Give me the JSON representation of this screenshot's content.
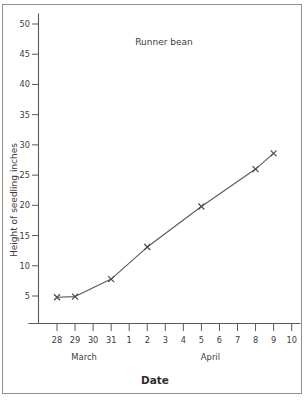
{
  "chart_data": {
    "type": "line",
    "title": "Runner bean",
    "xlabel": "Date",
    "ylabel": "Height of seedling   inches",
    "ylim": [
      0,
      52
    ],
    "xlim": [
      0,
      13
    ],
    "grid": false,
    "legend": "none",
    "y_ticks": [
      5,
      10,
      15,
      20,
      25,
      30,
      35,
      40,
      45,
      50
    ],
    "y_tick_labels": [
      "5",
      "10",
      "15",
      "20",
      "25",
      "30",
      "35",
      "40",
      "45",
      "50"
    ],
    "x_tick_labels": [
      "28",
      "29",
      "30",
      "31",
      "1",
      "2",
      "3",
      "4",
      "5",
      "6",
      "7",
      "8",
      "9",
      "10"
    ],
    "x_group_labels": [
      {
        "label": "March",
        "start_index": 0,
        "end_index": 3
      },
      {
        "label": "April",
        "start_index": 4,
        "end_index": 13
      }
    ],
    "series": [
      {
        "name": "Runner bean",
        "marker": "x",
        "color": "#595959",
        "points": [
          {
            "x_label": "28",
            "x_index": 0,
            "y": 4.8
          },
          {
            "x_label": "29",
            "x_index": 1,
            "y": 4.9
          },
          {
            "x_label": "31",
            "x_index": 3,
            "y": 7.8
          },
          {
            "x_label": "2",
            "x_index": 5,
            "y": 13.1
          },
          {
            "x_label": "5",
            "x_index": 8,
            "y": 19.8
          },
          {
            "x_label": "8",
            "x_index": 11,
            "y": 26.0
          },
          {
            "x_label": "9",
            "x_index": 12,
            "y": 28.6
          }
        ]
      }
    ]
  },
  "colors": {
    "ink": "#4a4a4a",
    "axis": "#5a5a5a",
    "frame": "#8d8d8d",
    "background": "#ffffff"
  }
}
